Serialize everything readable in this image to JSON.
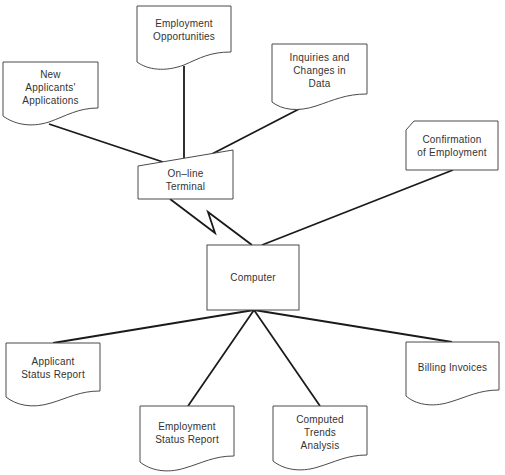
{
  "diagram": {
    "type": "system flowchart",
    "nodes": {
      "employment_opportunities": {
        "label": "Employment\nOpportunities",
        "shape": "document"
      },
      "new_applicants": {
        "label": "New\nApplicants'\nApplications",
        "shape": "document"
      },
      "inquiries": {
        "label": "Inquiries and\nChanges in\nData",
        "shape": "document"
      },
      "terminal": {
        "label": "On–line\nTerminal",
        "shape": "manual-input"
      },
      "confirmation": {
        "label": "Confirmation\nof Employment",
        "shape": "punched-card"
      },
      "computer": {
        "label": "Computer",
        "shape": "process"
      },
      "applicant_status": {
        "label": "Applicant\nStatus Report",
        "shape": "document"
      },
      "employment_status": {
        "label": "Employment\nStatus Report",
        "shape": "document"
      },
      "computed_trends": {
        "label": "Computed\nTrends\nAnalysis",
        "shape": "document"
      },
      "billing": {
        "label": "Billing Invoices",
        "shape": "document"
      }
    },
    "edges": [
      {
        "from": "New Applicants' Applications",
        "to": "On-line Terminal"
      },
      {
        "from": "Employment Opportunities",
        "to": "On-line Terminal"
      },
      {
        "from": "Inquiries and Changes in Data",
        "to": "On-line Terminal"
      },
      {
        "from": "On-line Terminal",
        "to": "Computer",
        "style": "communication-link"
      },
      {
        "from": "Confirmation of Employment",
        "to": "Computer"
      },
      {
        "from": "Computer",
        "to": "Applicant Status Report"
      },
      {
        "from": "Computer",
        "to": "Employment Status Report"
      },
      {
        "from": "Computer",
        "to": "Computed Trends Analysis"
      },
      {
        "from": "Computer",
        "to": "Billing Invoices"
      }
    ]
  }
}
